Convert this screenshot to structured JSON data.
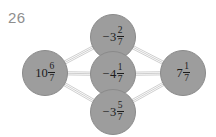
{
  "problem": {
    "number": "26"
  },
  "diagram": {
    "type": "node-link-graph",
    "background_color": "#ffffff",
    "node_fill_color": "#9d9d9d",
    "node_border_color": "#8a8a8a",
    "edge_color": "#c9c9c9",
    "label_color": "#8e8e8e",
    "text_color": "#1c1c1c",
    "nodes": [
      {
        "id": "left",
        "position": "left",
        "cx": 45,
        "cy": 73,
        "r": 23,
        "value": "10 6/7",
        "sign": "",
        "whole": "10",
        "numerator": "6",
        "denominator": "7"
      },
      {
        "id": "top",
        "position": "top-middle",
        "cx": 113,
        "cy": 37,
        "r": 23,
        "value": "-3 2/7",
        "sign": "−",
        "whole": "3",
        "numerator": "2",
        "denominator": "7"
      },
      {
        "id": "center",
        "position": "center-middle",
        "cx": 113,
        "cy": 74,
        "r": 23,
        "value": "-4 1/7",
        "sign": "−",
        "whole": "4",
        "numerator": "1",
        "denominator": "7"
      },
      {
        "id": "bottom",
        "position": "bottom-middle",
        "cx": 113,
        "cy": 112,
        "r": 23,
        "value": "-3 5/7",
        "sign": "−",
        "whole": "3",
        "numerator": "5",
        "denominator": "7"
      },
      {
        "id": "right",
        "position": "right",
        "cx": 183,
        "cy": 73,
        "r": 23,
        "value": "7 1/7",
        "sign": "",
        "whole": "7",
        "numerator": "1",
        "denominator": "7"
      }
    ],
    "edges": [
      {
        "from": "left",
        "to": "top"
      },
      {
        "from": "left",
        "to": "center"
      },
      {
        "from": "left",
        "to": "bottom"
      },
      {
        "from": "top",
        "to": "right"
      },
      {
        "from": "center",
        "to": "right"
      },
      {
        "from": "bottom",
        "to": "right"
      }
    ]
  }
}
